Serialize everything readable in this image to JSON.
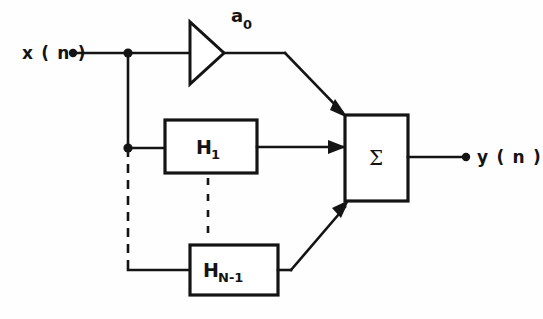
{
  "figure": {
    "type": "signal-flow-block-diagram",
    "background_color": "#fefefe",
    "line_color": "#141414"
  },
  "input": {
    "label": "x ( n )",
    "terminal_dot": true
  },
  "output": {
    "label": "y ( n )",
    "terminal_dot": true
  },
  "gain": {
    "symbol": "a",
    "subscript": "0",
    "shape": "triangle-amplifier"
  },
  "blocks": [
    {
      "symbol": "H",
      "subscript": "1",
      "name": "filter-block-h1"
    },
    {
      "symbol": "H",
      "subscript": "N-1",
      "name": "filter-block-hn1"
    }
  ],
  "summer": {
    "label": "Σ",
    "name": "summation-block",
    "inputs": 3
  },
  "ellipsis": {
    "style": "dashed",
    "meaning": "additional filter sections omitted"
  }
}
